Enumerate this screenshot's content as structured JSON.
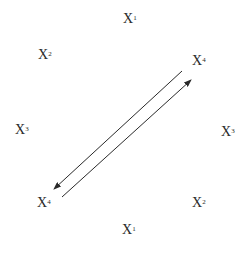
{
  "diagram": {
    "nodes": [
      {
        "id": "top",
        "base": "X",
        "sup": "1"
      },
      {
        "id": "ul",
        "base": "X",
        "sup": "2"
      },
      {
        "id": "ur",
        "base": "X",
        "sup": "4"
      },
      {
        "id": "left",
        "base": "X",
        "sup": "3"
      },
      {
        "id": "right",
        "base": "X",
        "sup": "3"
      },
      {
        "id": "ll",
        "base": "X",
        "sup": "4"
      },
      {
        "id": "lr",
        "base": "X",
        "sup": "2"
      },
      {
        "id": "bottom",
        "base": "X",
        "sup": "1"
      }
    ],
    "edges": [
      {
        "from": "ur",
        "to": "ll",
        "style": "arrow"
      },
      {
        "from": "ll",
        "to": "ur",
        "style": "arrow"
      }
    ],
    "colors": {
      "text": "#2a2a2a",
      "line": "#2a2a2a",
      "background": "#ffffff"
    }
  }
}
